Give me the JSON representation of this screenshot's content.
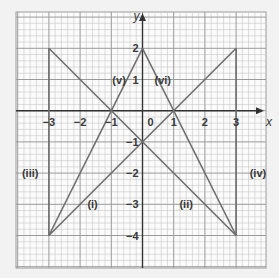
{
  "chart_data": {
    "type": "line",
    "title": "",
    "xlabel": "x",
    "ylabel": "y",
    "xlim": [
      -4,
      4
    ],
    "ylim": [
      -5,
      3
    ],
    "grid": true,
    "grid_minor_per_unit": 5,
    "x_ticks": [
      "-3",
      "-2",
      "-1",
      "0",
      "1",
      "2",
      "3"
    ],
    "y_ticks": [
      "2",
      "1",
      "-1",
      "-2",
      "-3",
      "-4"
    ],
    "series": [
      {
        "name": "(i)",
        "points": [
          [
            -3,
            -4
          ],
          [
            3,
            2
          ]
        ],
        "equation": "y = x - 1"
      },
      {
        "name": "(ii)",
        "points": [
          [
            -3,
            2
          ],
          [
            3,
            -4
          ]
        ],
        "equation": "y = -x - 1"
      },
      {
        "name": "(iii)",
        "points": [
          [
            -3,
            2
          ],
          [
            -3,
            -4
          ]
        ],
        "equation": "x = -3"
      },
      {
        "name": "(iv)",
        "points": [
          [
            3,
            2
          ],
          [
            3,
            -4
          ]
        ],
        "equation": "x = 3"
      },
      {
        "name": "(v)",
        "points": [
          [
            -3,
            -4
          ],
          [
            0,
            2
          ]
        ],
        "equation": "y = 2x + 2"
      },
      {
        "name": "(vi)",
        "points": [
          [
            0,
            2
          ],
          [
            3,
            -4
          ]
        ],
        "equation": "y = -2x + 2"
      }
    ],
    "annotations": [
      {
        "text": "(i)",
        "x": -1.6,
        "y": -3.0
      },
      {
        "text": "(ii)",
        "x": 1.4,
        "y": -3.0
      },
      {
        "text": "(iii)",
        "x": -3.6,
        "y": -2.0
      },
      {
        "text": "(iv)",
        "x": 3.7,
        "y": -2.0
      },
      {
        "text": "(v)",
        "x": -0.75,
        "y": 1.0
      },
      {
        "text": "(vi)",
        "x": 0.65,
        "y": 1.0
      }
    ],
    "colors": {
      "background": "#f2f2f2",
      "grid_bg": "#fbfbfb",
      "grid_minor": "#c8c8c8",
      "grid_major": "#9a9a9a",
      "axis": "#333333",
      "line": "#6e6e6e",
      "text": "#3a3a3a"
    }
  }
}
